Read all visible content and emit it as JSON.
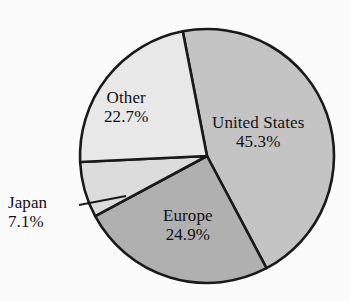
{
  "chart_data": {
    "type": "pie",
    "title": "",
    "categories": [
      "United States",
      "Europe",
      "Japan",
      "Other"
    ],
    "values": [
      45.3,
      24.9,
      7.1,
      22.7
    ],
    "value_labels": [
      "45.3%",
      "24.9%",
      "7.1%",
      "22.7%"
    ],
    "units": "percent",
    "legend": "none",
    "labels_position": "inside-slices-with-leader-for-japan",
    "start_angle_deg": -11,
    "direction": "clockwise",
    "colors": [
      "#c4c4c4",
      "#b0b0b0",
      "#dcdcdc",
      "#e8e8e8"
    ],
    "stroke_color": "#1a1a1a",
    "background": "#fbfbfb",
    "slices": [
      {
        "name": "United States",
        "value": 45.3,
        "value_label": "45.3%",
        "color": "#c4c4c4",
        "label_placement": "inside"
      },
      {
        "name": "Europe",
        "value": 24.9,
        "value_label": "24.9%",
        "color": "#b0b0b0",
        "label_placement": "inside"
      },
      {
        "name": "Japan",
        "value": 7.1,
        "value_label": "7.1%",
        "color": "#dcdcdc",
        "label_placement": "outside-with-leader-line"
      },
      {
        "name": "Other",
        "value": 22.7,
        "value_label": "22.7%",
        "color": "#e8e8e8",
        "label_placement": "inside"
      }
    ]
  },
  "labels": {
    "united_states": {
      "name": "United States",
      "pct": "45.3%"
    },
    "europe": {
      "name": "Europe",
      "pct": "24.9%"
    },
    "japan": {
      "name": "Japan",
      "pct": "7.1%"
    },
    "other": {
      "name": "Other",
      "pct": "22.7%"
    }
  }
}
